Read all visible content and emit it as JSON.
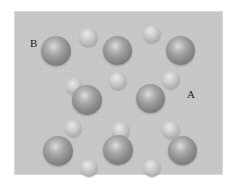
{
  "figure": {
    "type": "schematic-diagram",
    "background_color": "#ffffff",
    "panel": {
      "fill_color": "#c9c9c9",
      "x": 14,
      "y": 11,
      "width": 209,
      "height": 164
    }
  },
  "labels": [
    {
      "text": "B",
      "x": 30,
      "y": 38,
      "name": "label-b"
    },
    {
      "text": "A",
      "x": 187,
      "y": 89,
      "name": "label-a"
    }
  ],
  "legend_meaning": {
    "large_sphere": "B",
    "small_sphere": "A",
    "large_color": "#8d8d8d",
    "small_color": "#c9c9c9"
  },
  "atoms": [
    {
      "species": "A",
      "size": "small",
      "cx": 88,
      "cy": 37,
      "r": 9.5
    },
    {
      "species": "A",
      "size": "small",
      "cx": 152,
      "cy": 34,
      "r": 9.0
    },
    {
      "species": "B",
      "size": "large",
      "cx": 56,
      "cy": 51,
      "r": 15.0
    },
    {
      "species": "B",
      "size": "large",
      "cx": 117,
      "cy": 50,
      "r": 14.5
    },
    {
      "species": "B",
      "size": "large",
      "cx": 180,
      "cy": 50,
      "r": 14.5
    },
    {
      "species": "A",
      "size": "small",
      "cx": 118,
      "cy": 81,
      "r": 9.0
    },
    {
      "species": "A",
      "size": "small",
      "cx": 171,
      "cy": 80,
      "r": 9.0
    },
    {
      "species": "A",
      "size": "small",
      "cx": 74,
      "cy": 86,
      "r": 8.5
    },
    {
      "species": "B",
      "size": "large",
      "cx": 87,
      "cy": 100,
      "r": 15.0
    },
    {
      "species": "B",
      "size": "large",
      "cx": 150,
      "cy": 98,
      "r": 14.5
    },
    {
      "species": "A",
      "size": "small",
      "cx": 73,
      "cy": 128,
      "r": 8.5
    },
    {
      "species": "A",
      "size": "small",
      "cx": 121,
      "cy": 131,
      "r": 9.0
    },
    {
      "species": "A",
      "size": "small",
      "cx": 171,
      "cy": 130,
      "r": 9.0
    },
    {
      "species": "B",
      "size": "large",
      "cx": 58,
      "cy": 151,
      "r": 15.0
    },
    {
      "species": "B",
      "size": "large",
      "cx": 118,
      "cy": 150,
      "r": 15.0
    },
    {
      "species": "B",
      "size": "large",
      "cx": 182,
      "cy": 150,
      "r": 14.5
    },
    {
      "species": "A",
      "size": "small",
      "cx": 89,
      "cy": 168,
      "r": 9.0
    },
    {
      "species": "A",
      "size": "small",
      "cx": 152,
      "cy": 168,
      "r": 9.0
    }
  ]
}
